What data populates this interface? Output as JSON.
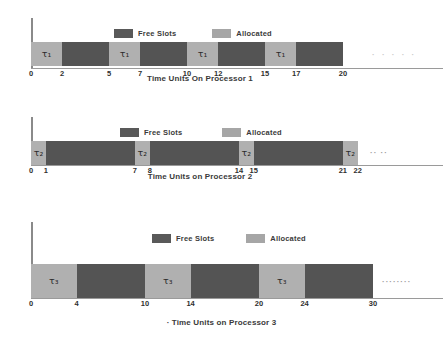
{
  "figure": {
    "background": "#ffffff",
    "colors": {
      "allocated": "#b0b0b0",
      "free_slots": "#545454",
      "axis": "#8a8a8a",
      "text": "#2f2f2f"
    }
  },
  "legend": {
    "free_label": "Free Slots",
    "allocated_label": "Allocated"
  },
  "chart_data": [
    {
      "type": "bar",
      "id": "processor-1",
      "title": "",
      "xlabel": "Time Units On Processor 1",
      "ylabel": "",
      "xlim": [
        0,
        24
      ],
      "grid": false,
      "legend": [
        "Free Slots",
        "Allocated"
      ],
      "legend_position": "top-center",
      "task_label": "τ₁",
      "tick_labels": [
        "0",
        "2",
        "5",
        "7",
        "10",
        "12",
        "15",
        "17",
        "20"
      ],
      "tick_values": [
        0,
        2,
        5,
        7,
        10,
        12,
        15,
        17,
        20
      ],
      "segments": [
        {
          "start": 0,
          "end": 2,
          "state": "Allocated",
          "label": "τ₁"
        },
        {
          "start": 2,
          "end": 5,
          "state": "Free Slots",
          "label": ""
        },
        {
          "start": 5,
          "end": 7,
          "state": "Allocated",
          "label": "τ₁"
        },
        {
          "start": 7,
          "end": 10,
          "state": "Free Slots",
          "label": ""
        },
        {
          "start": 10,
          "end": 12,
          "state": "Allocated",
          "label": "τ₁"
        },
        {
          "start": 12,
          "end": 15,
          "state": "Free Slots",
          "label": ""
        },
        {
          "start": 15,
          "end": 17,
          "state": "Allocated",
          "label": "τ₁"
        },
        {
          "start": 17,
          "end": 20,
          "state": "Free Slots",
          "label": ""
        }
      ],
      "continuation": "· · · · ·"
    },
    {
      "type": "bar",
      "id": "processor-2",
      "title": "",
      "xlabel": "Time Units on Processor 2",
      "ylabel": "",
      "xlim": [
        0,
        26
      ],
      "grid": false,
      "legend": [
        "Free Slots",
        "Allocated"
      ],
      "legend_position": "top-center",
      "task_label": "τ₂",
      "tick_labels": [
        "0",
        "1",
        "7",
        "8",
        "14",
        "15",
        "21",
        "22"
      ],
      "tick_values": [
        0,
        1,
        7,
        8,
        14,
        15,
        21,
        22
      ],
      "segments": [
        {
          "start": 0,
          "end": 1,
          "state": "Allocated",
          "label": "τ₂"
        },
        {
          "start": 1,
          "end": 7,
          "state": "Free Slots",
          "label": ""
        },
        {
          "start": 7,
          "end": 8,
          "state": "Allocated",
          "label": "τ₂"
        },
        {
          "start": 8,
          "end": 14,
          "state": "Free Slots",
          "label": ""
        },
        {
          "start": 14,
          "end": 15,
          "state": "Allocated",
          "label": "τ₂"
        },
        {
          "start": 15,
          "end": 21,
          "state": "Free Slots",
          "label": ""
        },
        {
          "start": 21,
          "end": 22,
          "state": "Allocated",
          "label": "τ₂"
        }
      ],
      "continuation": "·· ··"
    },
    {
      "type": "bar",
      "id": "processor-3",
      "title": "",
      "xlabel": "· Time Units on Processor 3",
      "ylabel": "",
      "xlim": [
        0,
        38
      ],
      "grid": false,
      "legend": [
        "Free Slots",
        "Allocated"
      ],
      "legend_position": "top-center",
      "task_label": "τ₃",
      "tick_labels": [
        "0",
        "4",
        "10",
        "14",
        "20",
        "24",
        "30"
      ],
      "tick_values": [
        0,
        4,
        10,
        14,
        20,
        24,
        30
      ],
      "segments": [
        {
          "start": 0,
          "end": 4,
          "state": "Allocated",
          "label": "τ₃"
        },
        {
          "start": 4,
          "end": 10,
          "state": "Free Slots",
          "label": ""
        },
        {
          "start": 10,
          "end": 14,
          "state": "Allocated",
          "label": "τ₃"
        },
        {
          "start": 14,
          "end": 20,
          "state": "Free Slots",
          "label": ""
        },
        {
          "start": 20,
          "end": 24,
          "state": "Allocated",
          "label": "τ₃"
        },
        {
          "start": 24,
          "end": 30,
          "state": "Free Slots",
          "label": ""
        }
      ],
      "continuation": "········"
    }
  ]
}
